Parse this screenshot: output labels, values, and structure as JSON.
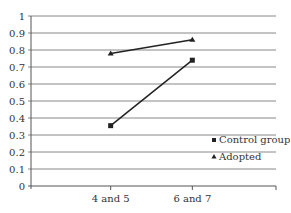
{
  "chart_data": {
    "type": "line",
    "title": "",
    "xlabel": "",
    "ylabel": "",
    "categories": [
      "4 and 5",
      "6 and 7"
    ],
    "ylim": [
      0,
      1
    ],
    "yticks": [
      "0",
      "0.1",
      "0.2",
      "0.3",
      "0.4",
      "0.5",
      "0.6",
      "0.7",
      "0.8",
      "0.9",
      "1"
    ],
    "grid": true,
    "legend_position": "bottom-right",
    "series": [
      {
        "name": "Control group",
        "marker": "square",
        "values": [
          0.355,
          0.74
        ]
      },
      {
        "name": "Adopted",
        "marker": "triangle",
        "values": [
          0.78,
          0.86
        ]
      }
    ],
    "colors": {
      "line": "#222222",
      "grid": "#888888"
    }
  }
}
